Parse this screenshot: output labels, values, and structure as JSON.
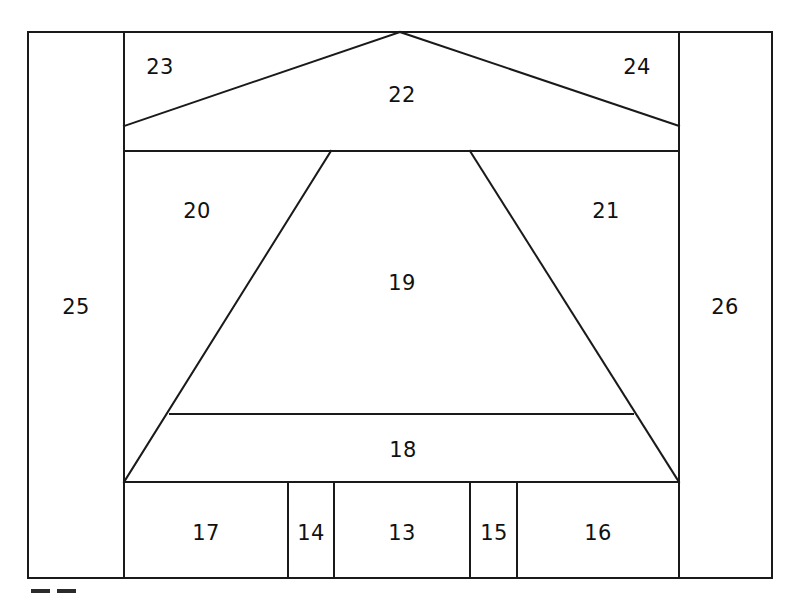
{
  "figure": {
    "type": "technical-line-drawing",
    "canvas": {
      "width": 797,
      "height": 606
    },
    "stroke_color": "#1a1a1a",
    "fill_color": "#ffffff",
    "text_color": "#111111",
    "stroke_width": 2
  },
  "geometry": {
    "frame": {
      "left": 28,
      "top": 32,
      "right": 772,
      "bottom": 578
    },
    "left_column_x": 124,
    "right_column_x": 679,
    "eaves_y": 151,
    "base_y": 482,
    "apex": {
      "x": 400,
      "y": 32
    },
    "roof_left_end": {
      "x": 124,
      "y": 126
    },
    "roof_right_end": {
      "x": 679,
      "y": 126
    },
    "trapezoid_top_left": {
      "x": 331,
      "y": 151
    },
    "trapezoid_top_right": {
      "x": 470,
      "y": 151
    },
    "trapezoid_bottom_left": {
      "x": 124,
      "y": 482
    },
    "trapezoid_bottom_right": {
      "x": 679,
      "y": 482
    },
    "chord_y": 414,
    "chord_left_x": 170,
    "chord_right_x": 633,
    "bottom_dividers": [
      288,
      334,
      470,
      517
    ]
  },
  "callouts": [
    {
      "id": "callout-13",
      "label": "13",
      "x": 402,
      "y": 534,
      "region": "bottom-cell-center"
    },
    {
      "id": "callout-14",
      "label": "14",
      "x": 311,
      "y": 534,
      "region": "bottom-cell-narrow-left"
    },
    {
      "id": "callout-15",
      "label": "15",
      "x": 494,
      "y": 534,
      "region": "bottom-cell-narrow-right"
    },
    {
      "id": "callout-16",
      "label": "16",
      "x": 598,
      "y": 534,
      "region": "bottom-cell-right"
    },
    {
      "id": "callout-17",
      "label": "17",
      "x": 206,
      "y": 534,
      "region": "bottom-cell-left"
    },
    {
      "id": "callout-18",
      "label": "18",
      "x": 403,
      "y": 451,
      "region": "lower-band"
    },
    {
      "id": "callout-19",
      "label": "19",
      "x": 402,
      "y": 284,
      "region": "central-trapezoid"
    },
    {
      "id": "callout-20",
      "label": "20",
      "x": 197,
      "y": 212,
      "region": "left-flank"
    },
    {
      "id": "callout-21",
      "label": "21",
      "x": 606,
      "y": 212,
      "region": "right-flank"
    },
    {
      "id": "callout-22",
      "label": "22",
      "x": 402,
      "y": 96,
      "region": "roof-center"
    },
    {
      "id": "callout-23",
      "label": "23",
      "x": 160,
      "y": 68,
      "region": "roof-left-corner"
    },
    {
      "id": "callout-24",
      "label": "24",
      "x": 637,
      "y": 68,
      "region": "roof-right-corner"
    },
    {
      "id": "callout-25",
      "label": "25",
      "x": 76,
      "y": 308,
      "region": "left-column"
    },
    {
      "id": "callout-26",
      "label": "26",
      "x": 725,
      "y": 308,
      "region": "right-column"
    }
  ],
  "corner_marks": [
    {
      "id": "dash-left",
      "x": 31,
      "y": 589,
      "width": 19,
      "height": 4
    },
    {
      "id": "dash-right",
      "x": 57,
      "y": 589,
      "width": 19,
      "height": 4
    }
  ]
}
